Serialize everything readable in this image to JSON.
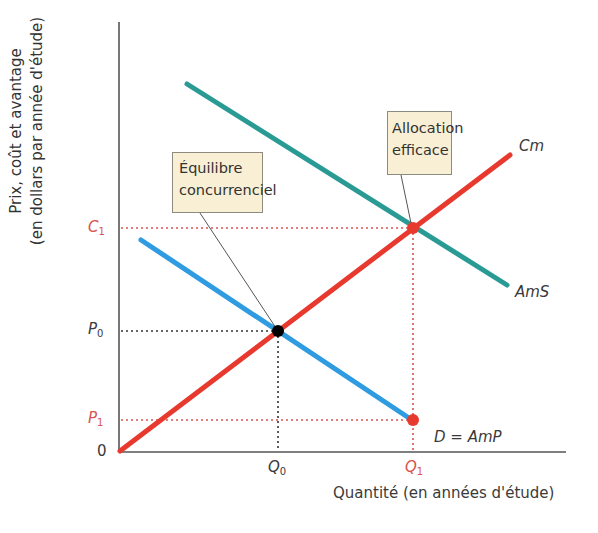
{
  "axes": {
    "y_label_line1": "Prix, coût et avantage",
    "y_label_line2": "(en dollars par année d'étude)",
    "x_label": "Quantité (en années d'étude)",
    "origin": "0"
  },
  "ticks": {
    "y": [
      {
        "main": "C",
        "sub": "1",
        "color": "#d9534f"
      },
      {
        "main": "P",
        "sub": "0",
        "color": "#333333"
      },
      {
        "main": "P",
        "sub": "1",
        "color": "#d9534f"
      }
    ],
    "x": [
      {
        "main": "Q",
        "sub": "0",
        "color": "#333333"
      },
      {
        "main": "Q",
        "sub": "1",
        "color": "#d9534f"
      }
    ]
  },
  "curves": {
    "cm": {
      "label": "Cm",
      "color": "#e8392f"
    },
    "ams": {
      "label": "AmS",
      "color": "#2a9a95"
    },
    "demand": {
      "label": "D = AmP",
      "color": "#2f9be0"
    }
  },
  "callouts": {
    "equilibrium_line1": "Équilibre",
    "equilibrium_line2": "concurrenciel",
    "efficient_line1": "Allocation",
    "efficient_line2": "efficace"
  },
  "colors": {
    "callout_bg": "#f8efd4",
    "guide_red": "#d9534f",
    "guide_black": "#333333",
    "point_black": "#000000",
    "point_red": "#e8392f"
  }
}
